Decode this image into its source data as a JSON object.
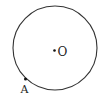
{
  "diagram": {
    "type": "geometry-circle",
    "circle": {
      "cx": 55,
      "cy": 48,
      "r": 42,
      "stroke": "#333333",
      "stroke_width": 1.1
    },
    "center_point": {
      "label": "O",
      "x": 54.5,
      "y": 50.5,
      "label_x": 57.5,
      "label_y": 55.5
    },
    "points": [
      {
        "label": "A",
        "x": 25.5,
        "y": 79,
        "label_x": 20.5,
        "label_y": 92.5
      }
    ],
    "colors": {
      "line": "#333333",
      "point": "#111111",
      "text": "#222222"
    }
  }
}
